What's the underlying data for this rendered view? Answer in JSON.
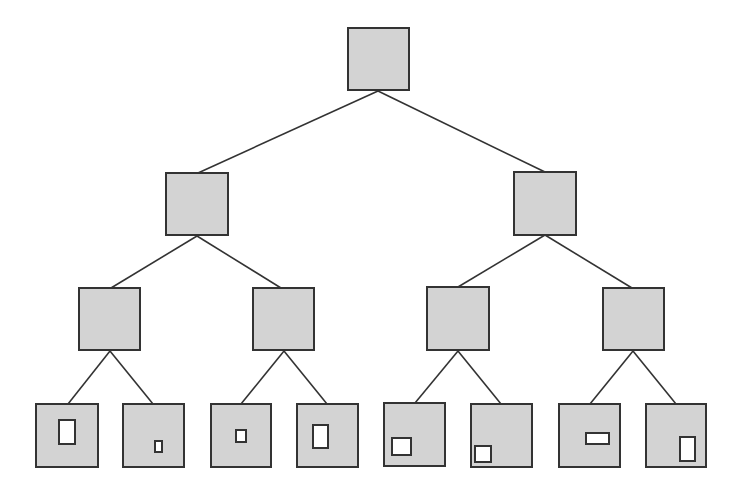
{
  "diagram": {
    "type": "binary-tree",
    "levels": 4,
    "colors": {
      "background": "#ffffff",
      "node_fill": "#d3d3d3",
      "node_stroke": "#333333",
      "edge_stroke": "#333333",
      "inner_fill": "#ffffff"
    },
    "nodes": [
      {
        "id": "n0",
        "level": 0,
        "x": 348,
        "y": 28,
        "w": 61,
        "h": 62
      },
      {
        "id": "n1",
        "level": 1,
        "x": 166,
        "y": 173,
        "w": 62,
        "h": 62
      },
      {
        "id": "n2",
        "level": 1,
        "x": 514,
        "y": 172,
        "w": 62,
        "h": 63
      },
      {
        "id": "n3",
        "level": 2,
        "x": 79,
        "y": 288,
        "w": 61,
        "h": 62
      },
      {
        "id": "n4",
        "level": 2,
        "x": 253,
        "y": 288,
        "w": 61,
        "h": 62
      },
      {
        "id": "n5",
        "level": 2,
        "x": 427,
        "y": 287,
        "w": 62,
        "h": 63
      },
      {
        "id": "n6",
        "level": 2,
        "x": 603,
        "y": 288,
        "w": 61,
        "h": 62
      },
      {
        "id": "n7",
        "level": 3,
        "x": 36,
        "y": 404,
        "w": 62,
        "h": 63,
        "inner": {
          "x": 59,
          "y": 420,
          "w": 16,
          "h": 24
        }
      },
      {
        "id": "n8",
        "level": 3,
        "x": 123,
        "y": 404,
        "w": 61,
        "h": 63,
        "inner": {
          "x": 155,
          "y": 441,
          "w": 7,
          "h": 11
        }
      },
      {
        "id": "n9",
        "level": 3,
        "x": 211,
        "y": 404,
        "w": 60,
        "h": 63,
        "inner": {
          "x": 236,
          "y": 430,
          "w": 10,
          "h": 12
        }
      },
      {
        "id": "n10",
        "level": 3,
        "x": 297,
        "y": 404,
        "w": 61,
        "h": 63,
        "inner": {
          "x": 313,
          "y": 425,
          "w": 15,
          "h": 23
        }
      },
      {
        "id": "n11",
        "level": 3,
        "x": 384,
        "y": 403,
        "w": 61,
        "h": 63,
        "inner": {
          "x": 392,
          "y": 438,
          "w": 19,
          "h": 17
        }
      },
      {
        "id": "n12",
        "level": 3,
        "x": 471,
        "y": 404,
        "w": 61,
        "h": 63,
        "inner": {
          "x": 475,
          "y": 446,
          "w": 16,
          "h": 16
        }
      },
      {
        "id": "n13",
        "level": 3,
        "x": 559,
        "y": 404,
        "w": 61,
        "h": 63,
        "inner": {
          "x": 586,
          "y": 433,
          "w": 23,
          "h": 11
        }
      },
      {
        "id": "n14",
        "level": 3,
        "x": 646,
        "y": 404,
        "w": 60,
        "h": 63,
        "inner": {
          "x": 680,
          "y": 437,
          "w": 15,
          "h": 24
        }
      }
    ],
    "edges": [
      {
        "from": "n0",
        "to": "n1",
        "x1": 378,
        "y1": 91,
        "x2": 198,
        "y2": 173
      },
      {
        "from": "n0",
        "to": "n2",
        "x1": 378,
        "y1": 91,
        "x2": 545,
        "y2": 172
      },
      {
        "from": "n1",
        "to": "n3",
        "x1": 197,
        "y1": 236,
        "x2": 111,
        "y2": 288
      },
      {
        "from": "n1",
        "to": "n4",
        "x1": 197,
        "y1": 236,
        "x2": 281,
        "y2": 288
      },
      {
        "from": "n2",
        "to": "n5",
        "x1": 545,
        "y1": 235,
        "x2": 458,
        "y2": 287
      },
      {
        "from": "n2",
        "to": "n6",
        "x1": 545,
        "y1": 235,
        "x2": 632,
        "y2": 288
      },
      {
        "from": "n3",
        "to": "n7",
        "x1": 110,
        "y1": 351,
        "x2": 68,
        "y2": 404
      },
      {
        "from": "n3",
        "to": "n8",
        "x1": 110,
        "y1": 351,
        "x2": 153,
        "y2": 404
      },
      {
        "from": "n4",
        "to": "n9",
        "x1": 284,
        "y1": 351,
        "x2": 241,
        "y2": 404
      },
      {
        "from": "n4",
        "to": "n10",
        "x1": 284,
        "y1": 351,
        "x2": 327,
        "y2": 404
      },
      {
        "from": "n5",
        "to": "n11",
        "x1": 458,
        "y1": 351,
        "x2": 415,
        "y2": 403
      },
      {
        "from": "n5",
        "to": "n12",
        "x1": 458,
        "y1": 351,
        "x2": 501,
        "y2": 404
      },
      {
        "from": "n6",
        "to": "n13",
        "x1": 633,
        "y1": 351,
        "x2": 590,
        "y2": 404
      },
      {
        "from": "n6",
        "to": "n14",
        "x1": 633,
        "y1": 351,
        "x2": 676,
        "y2": 404
      }
    ]
  }
}
